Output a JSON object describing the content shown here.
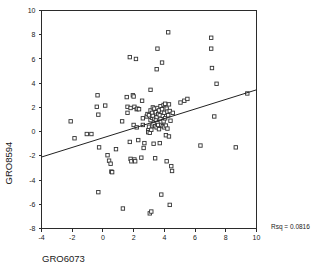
{
  "chart_data": {
    "type": "scatter",
    "title": "",
    "xlabel": "GRO6073",
    "ylabel": "GRO8594",
    "xlim": [
      -4,
      10
    ],
    "ylim": [
      -8,
      10
    ],
    "xticks": [
      -4,
      -2,
      0,
      2,
      4,
      6,
      8,
      10
    ],
    "yticks": [
      -8,
      -6,
      -4,
      -2,
      0,
      2,
      4,
      6,
      8,
      10
    ],
    "xtick_labels": [
      "-4",
      "-2",
      "0",
      "2",
      "4",
      "6",
      "8",
      "10"
    ],
    "ytick_labels": [
      "-8",
      "-6",
      "-4",
      "-2",
      "0",
      "2",
      "4",
      "6",
      "8",
      "10"
    ],
    "grid": false,
    "legend": null,
    "marker_style": "open-square",
    "annotations": [
      {
        "name": "rsq-annotation",
        "text": "Rsq = 0.0816",
        "x": 10.8,
        "y": -7.9
      }
    ],
    "rsq": 0.0816,
    "fit_line": {
      "type": "linear-regression",
      "slope": 0.3964,
      "intercept": -0.514,
      "x_start": -4.0,
      "y_start": -2.1,
      "x_end": 10.0,
      "y_end": 3.45
    },
    "points": [
      [
        -2.1,
        0.85
      ],
      [
        -1.85,
        -0.55
      ],
      [
        -1.05,
        -0.2
      ],
      [
        -0.75,
        -0.2
      ],
      [
        -0.35,
        3.0
      ],
      [
        -0.4,
        2.05
      ],
      [
        -0.3,
        1.4
      ],
      [
        -0.25,
        -1.3
      ],
      [
        -0.3,
        -5.0
      ],
      [
        0.15,
        2.15
      ],
      [
        0.3,
        -1.95
      ],
      [
        0.4,
        -2.4
      ],
      [
        0.5,
        -2.65
      ],
      [
        0.55,
        -3.3
      ],
      [
        0.6,
        -3.35
      ],
      [
        0.85,
        -1.45
      ],
      [
        1.25,
        0.85
      ],
      [
        1.3,
        -6.35
      ],
      [
        1.55,
        2.85
      ],
      [
        1.6,
        1.55
      ],
      [
        1.6,
        2.05
      ],
      [
        1.75,
        6.15
      ],
      [
        1.8,
        1.95
      ],
      [
        1.75,
        -0.85
      ],
      [
        1.8,
        -2.25
      ],
      [
        1.85,
        -2.45
      ],
      [
        1.95,
        3.0
      ],
      [
        2.0,
        2.9
      ],
      [
        2.05,
        2.05
      ],
      [
        2.0,
        0.55
      ],
      [
        2.05,
        -2.3
      ],
      [
        2.1,
        -2.45
      ],
      [
        2.15,
        6.0
      ],
      [
        2.2,
        1.85
      ],
      [
        2.25,
        1.9
      ],
      [
        2.2,
        0.35
      ],
      [
        2.3,
        -0.7
      ],
      [
        2.35,
        1.85
      ],
      [
        2.5,
        -2.15
      ],
      [
        2.55,
        2.55
      ],
      [
        2.6,
        1.1
      ],
      [
        2.6,
        0.55
      ],
      [
        2.65,
        -1.35
      ],
      [
        2.7,
        -0.95
      ],
      [
        2.85,
        1.25
      ],
      [
        2.9,
        1.45
      ],
      [
        2.95,
        0.1
      ],
      [
        2.95,
        -0.05
      ],
      [
        3.0,
        1.35
      ],
      [
        3.0,
        0.4
      ],
      [
        3.05,
        -0.1
      ],
      [
        3.05,
        -6.75
      ],
      [
        3.1,
        3.45
      ],
      [
        3.1,
        1.75
      ],
      [
        3.1,
        0.95
      ],
      [
        3.15,
        0.15
      ],
      [
        3.15,
        -6.6
      ],
      [
        3.2,
        1.55
      ],
      [
        3.2,
        1.15
      ],
      [
        3.2,
        0.5
      ],
      [
        3.25,
        2.0
      ],
      [
        3.25,
        1.3
      ],
      [
        3.3,
        0.6
      ],
      [
        3.3,
        -1.0
      ],
      [
        3.35,
        1.9
      ],
      [
        3.35,
        1.05
      ],
      [
        3.4,
        0.45
      ],
      [
        3.4,
        -2.2
      ],
      [
        3.45,
        1.6
      ],
      [
        3.45,
        0.95
      ],
      [
        3.5,
        5.15
      ],
      [
        3.5,
        1.2
      ],
      [
        3.5,
        0.35
      ],
      [
        3.55,
        6.85
      ],
      [
        3.55,
        1.95
      ],
      [
        3.55,
        0.7
      ],
      [
        3.6,
        1.45
      ],
      [
        3.6,
        0.55
      ],
      [
        3.65,
        1.75
      ],
      [
        3.65,
        0.2
      ],
      [
        3.7,
        1.35
      ],
      [
        3.7,
        -0.95
      ],
      [
        3.75,
        2.1
      ],
      [
        3.75,
        1.05
      ],
      [
        3.8,
        0.55
      ],
      [
        3.8,
        -5.2
      ],
      [
        3.85,
        5.7
      ],
      [
        3.85,
        1.85
      ],
      [
        3.9,
        1.3
      ],
      [
        3.9,
        0.45
      ],
      [
        3.95,
        2.2
      ],
      [
        3.95,
        0.85
      ],
      [
        4.0,
        1.55
      ],
      [
        4.0,
        0.35
      ],
      [
        4.05,
        2.3
      ],
      [
        4.05,
        1.1
      ],
      [
        4.1,
        0.5
      ],
      [
        4.1,
        -0.3
      ],
      [
        4.15,
        1.9
      ],
      [
        4.15,
        -2.45
      ],
      [
        4.2,
        1.65
      ],
      [
        4.2,
        0.25
      ],
      [
        4.25,
        8.2
      ],
      [
        4.25,
        1.35
      ],
      [
        4.3,
        2.25
      ],
      [
        4.3,
        -0.4
      ],
      [
        4.35,
        1.7
      ],
      [
        4.35,
        -6.05
      ],
      [
        4.4,
        0.9
      ],
      [
        4.45,
        -2.85
      ],
      [
        4.5,
        -3.25
      ],
      [
        4.55,
        1.55
      ],
      [
        5.05,
        2.4
      ],
      [
        5.3,
        2.55
      ],
      [
        5.5,
        2.7
      ],
      [
        6.35,
        -1.15
      ],
      [
        7.05,
        7.75
      ],
      [
        7.05,
        6.85
      ],
      [
        7.1,
        5.25
      ],
      [
        7.25,
        1.25
      ],
      [
        7.4,
        3.95
      ],
      [
        8.65,
        -1.3
      ],
      [
        9.4,
        3.15
      ]
    ]
  },
  "figure": {
    "background_color": "#ffffff",
    "axis_color": "#2b2b2b",
    "marker_fill": "#ffffff",
    "marker_stroke": "#333333",
    "line_color": "#222222"
  }
}
